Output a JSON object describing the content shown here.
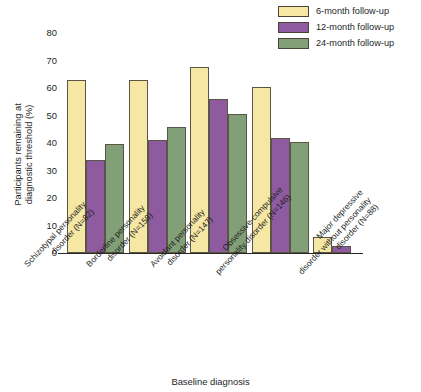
{
  "chart_data": {
    "type": "bar",
    "title": "",
    "xlabel": "Baseline diagnosis",
    "ylabel": "Participants remaining at diagnostic threshold (%)",
    "ylim": [
      0,
      80
    ],
    "yticks": [
      0,
      10,
      20,
      30,
      40,
      50,
      60,
      70,
      80
    ],
    "grid": false,
    "legend_position": "top-right",
    "categories": [
      "Schizotypal personality disorder (N=82)",
      "Borderline personality disorder (N=158)",
      "Avoidant personality disorder (N=147)",
      "Obsessive-compulsive personality disorder (N=146)",
      "Major depressive disorder without personality disorder (N=88)"
    ],
    "category_lines": [
      [
        "Schizotypal personality",
        "disorder (N=82)"
      ],
      [
        "Borderline personality",
        "disorder (N=158)"
      ],
      [
        "Avoidant personality",
        "disorder (N=147)"
      ],
      [
        "Obsessive-compulsive",
        "personality disorder (N=146)"
      ],
      [
        "Major depressive",
        "disorder without personality",
        "disorder (N=88)"
      ]
    ],
    "series": [
      {
        "name": "6-month follow-up",
        "color": "#f7e7a4",
        "values": [
          63,
          63,
          67.5,
          60.5,
          6
        ]
      },
      {
        "name": "12-month follow-up",
        "color": "#8e5ba0",
        "values": [
          34,
          41,
          56,
          42,
          2.5
        ]
      },
      {
        "name": "24-month follow-up",
        "color": "#82a077",
        "values": [
          39.5,
          46,
          50.5,
          40.5,
          0
        ]
      }
    ]
  },
  "legend": {
    "items": [
      {
        "label": "6-month follow-up",
        "color": "#f7e7a4"
      },
      {
        "label": "12-month follow-up",
        "color": "#8e5ba0"
      },
      {
        "label": "24-month follow-up",
        "color": "#82a077"
      }
    ]
  },
  "axes": {
    "y_title": "Participants remaining at diagnostic threshold (%)",
    "y_title_lines": [
      "Participants remaining at",
      "diagnostic threshold (%)"
    ],
    "x_title": "Baseline diagnosis",
    "y_tick_labels": [
      "0",
      "10",
      "20",
      "30",
      "40",
      "50",
      "60",
      "70",
      "80"
    ]
  }
}
